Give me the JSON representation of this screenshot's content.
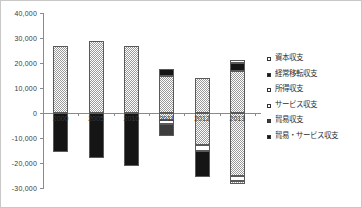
{
  "chart_data": {
    "type": "bar",
    "subtype": "stacked-column",
    "title": "",
    "xlabel": "",
    "ylabel": "",
    "grid": false,
    "legend_position": "right",
    "ylim": [
      -30000,
      40000
    ],
    "ytick_step": 10000,
    "yticks": [
      "40,000",
      "30,000",
      "20,000",
      "10,000",
      "0",
      "-10,000",
      "-20,000",
      "-30,000"
    ],
    "ytick_values": [
      40000,
      30000,
      20000,
      10000,
      0,
      -10000,
      -20000,
      -30000
    ],
    "categories": [
      "2000",
      "2005",
      "2010",
      "2011",
      "2012",
      "2013"
    ],
    "legend": [
      {
        "label": "資本収支",
        "fill": "white"
      },
      {
        "label": "経常移転収支",
        "fill": "black"
      },
      {
        "label": "所得収支",
        "fill": "white"
      },
      {
        "label": "サービス収支",
        "fill": "white"
      },
      {
        "label": "貿易収支",
        "fill": "dark"
      },
      {
        "label": "貿易・サービス収支",
        "fill": "black"
      }
    ],
    "bars": [
      {
        "category": "2000",
        "positive_total": 26800,
        "negative_total": -15600,
        "segments": [
          {
            "value": 26800,
            "fill": "checker"
          },
          {
            "value": -15600,
            "fill": "black"
          }
        ]
      },
      {
        "category": "2005",
        "positive_total": 29000,
        "negative_total": -18000,
        "segments": [
          {
            "value": 29000,
            "fill": "checker"
          },
          {
            "value": -18000,
            "fill": "black"
          }
        ]
      },
      {
        "category": "2010",
        "positive_total": 26800,
        "negative_total": -21200,
        "segments": [
          {
            "value": 26800,
            "fill": "checker"
          },
          {
            "value": -21200,
            "fill": "black"
          }
        ]
      },
      {
        "category": "2011",
        "positive_total": 17600,
        "negative_total": -9200,
        "segments": [
          {
            "value": 14800,
            "fill": "checker"
          },
          {
            "value": 2800,
            "fill": "black"
          },
          {
            "value": -2800,
            "fill": "checker"
          },
          {
            "value": -1600,
            "fill": "white"
          },
          {
            "value": -4800,
            "fill": "dark"
          }
        ]
      },
      {
        "category": "2012",
        "positive_total": 14000,
        "negative_total": -25600,
        "segments": [
          {
            "value": 14000,
            "fill": "checker"
          },
          {
            "value": -12800,
            "fill": "checker"
          },
          {
            "value": -2400,
            "fill": "white"
          },
          {
            "value": -10400,
            "fill": "black"
          }
        ]
      },
      {
        "category": "2013",
        "positive_total": 21200,
        "negative_total": -28400,
        "segments": [
          {
            "value": 16800,
            "fill": "checker"
          },
          {
            "value": 3200,
            "fill": "black"
          },
          {
            "value": 1200,
            "fill": "white"
          },
          {
            "value": -25200,
            "fill": "checker"
          },
          {
            "value": -2000,
            "fill": "white"
          },
          {
            "value": -1200,
            "fill": "checker"
          }
        ]
      }
    ]
  }
}
